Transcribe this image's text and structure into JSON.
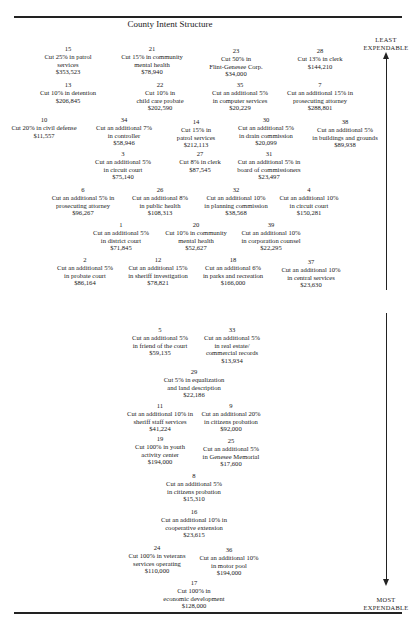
{
  "title": "County Intent Structure",
  "axis": {
    "top_label_line1": "LEAST",
    "top_label_line2": "EXPENDABLE",
    "bottom_label_line1": "MOST",
    "bottom_label_line2": "EXPENDABLE"
  },
  "items": [
    {
      "num": "15",
      "lines": [
        "Cut 25% in patrol",
        "services"
      ],
      "amount": "$353,523",
      "x": 68,
      "y": 45
    },
    {
      "num": "21",
      "lines": [
        "Cut 15% in community",
        "mental health"
      ],
      "amount": "$78,940",
      "x": 152,
      "y": 45
    },
    {
      "num": "23",
      "lines": [
        "Cut 50% in",
        "Flint-Genesee Corp."
      ],
      "amount": "$34,000",
      "x": 236,
      "y": 47
    },
    {
      "num": "28",
      "lines": [
        "Cut 13% in clerk"
      ],
      "amount": "$144,210",
      "x": 320,
      "y": 47
    },
    {
      "num": "13",
      "lines": [
        "Cut 10% in detention"
      ],
      "amount": "$206,845",
      "x": 68,
      "y": 81
    },
    {
      "num": "22",
      "lines": [
        "Cut 10% in",
        "child care probate"
      ],
      "amount": "$202,590",
      "x": 160,
      "y": 81
    },
    {
      "num": "35",
      "lines": [
        "Cut an additional 5%",
        "in computer services"
      ],
      "amount": "$20,229",
      "x": 240,
      "y": 81
    },
    {
      "num": "7",
      "lines": [
        "Cut an additional 15% in",
        "prosecuting attorney"
      ],
      "amount": "$288,801",
      "x": 320,
      "y": 81
    },
    {
      "num": "10",
      "lines": [
        "Cut 20% in civil defense"
      ],
      "amount": "$11,557",
      "x": 44,
      "y": 116
    },
    {
      "num": "34",
      "lines": [
        "Cut an additional 7%",
        "in controller"
      ],
      "amount": "$58,946",
      "x": 124,
      "y": 116
    },
    {
      "num": "14",
      "lines": [
        "Cut 15% in",
        "patrol services"
      ],
      "amount": "$212,113",
      "x": 196,
      "y": 118
    },
    {
      "num": "30",
      "lines": [
        "Cut an additional 5%",
        "in drain commission"
      ],
      "amount": "$20,099",
      "x": 266,
      "y": 116
    },
    {
      "num": "38",
      "lines": [
        "Cut an additional 5%",
        "in buildings and grounds"
      ],
      "amount": "$89,938",
      "x": 345,
      "y": 118
    },
    {
      "num": "3",
      "lines": [
        "Cut an additional 5%",
        "in circuit court"
      ],
      "amount": "$75,140",
      "x": 123,
      "y": 150
    },
    {
      "num": "27",
      "lines": [
        "Cut 8% in clerk"
      ],
      "amount": "$87,545",
      "x": 200,
      "y": 150
    },
    {
      "num": "31",
      "lines": [
        "Cut an additional 5% in",
        "board of commissioners"
      ],
      "amount": "$23,497",
      "x": 269,
      "y": 150
    },
    {
      "num": "6",
      "lines": [
        "Cut an additional 5% in",
        "prosecuting attorney"
      ],
      "amount": "$96,267",
      "x": 83,
      "y": 186
    },
    {
      "num": "26",
      "lines": [
        "Cut an additional 8%",
        "in public health"
      ],
      "amount": "$108,313",
      "x": 160,
      "y": 186
    },
    {
      "num": "32",
      "lines": [
        "Cut an additional 10%",
        "in planning commission"
      ],
      "amount": "$38,568",
      "x": 236,
      "y": 186
    },
    {
      "num": "4",
      "lines": [
        "Cut an additional 10%",
        "in circuit court"
      ],
      "amount": "$150,281",
      "x": 309,
      "y": 186
    },
    {
      "num": "1",
      "lines": [
        "Cut an additional 5%",
        "in district court"
      ],
      "amount": "$71,845",
      "x": 121,
      "y": 221
    },
    {
      "num": "20",
      "lines": [
        "Cut 10% in community",
        "mental health"
      ],
      "amount": "$52,627",
      "x": 196,
      "y": 221
    },
    {
      "num": "39",
      "lines": [
        "Cut an additional 10%",
        "in corporation counsel"
      ],
      "amount": "$22,295",
      "x": 271,
      "y": 221
    },
    {
      "num": "2",
      "lines": [
        "Cut an additional 5%",
        "in probate court"
      ],
      "amount": "$86,164",
      "x": 85,
      "y": 256
    },
    {
      "num": "12",
      "lines": [
        "Cut an additional 15%",
        "in sheriff investigation"
      ],
      "amount": "$78,821",
      "x": 158,
      "y": 256
    },
    {
      "num": "18",
      "lines": [
        "Cut an additional 6%",
        "in parks and recreation"
      ],
      "amount": "$166,000",
      "x": 233,
      "y": 256
    },
    {
      "num": "37",
      "lines": [
        "Cut an additional 10%",
        "in central services"
      ],
      "amount": "$23,630",
      "x": 311,
      "y": 258
    },
    {
      "num": "5",
      "lines": [
        "Cut an additional 5%",
        "in friend of the court"
      ],
      "amount": "$59,135",
      "x": 160,
      "y": 326
    },
    {
      "num": "33",
      "lines": [
        "Cut an additional 5%",
        "in real estate/",
        "commercial records"
      ],
      "amount": "$13,934",
      "x": 232,
      "y": 326
    },
    {
      "num": "29",
      "lines": [
        "Cut 5% in equalization",
        "and land description"
      ],
      "amount": "$22,186",
      "x": 194,
      "y": 368
    },
    {
      "num": "11",
      "lines": [
        "Cut an additional 10% in",
        "sheriff staff services"
      ],
      "amount": "$41,224",
      "x": 160,
      "y": 402
    },
    {
      "num": "9",
      "lines": [
        "Cut an additional 20%",
        "in citizens probation"
      ],
      "amount": "$92,000",
      "x": 231,
      "y": 402
    },
    {
      "num": "19",
      "lines": [
        "Cut 100% in youth",
        "activity center"
      ],
      "amount": "$194,000",
      "x": 160,
      "y": 435
    },
    {
      "num": "25",
      "lines": [
        "Cut an additional 5%",
        "in Genesee Memorial"
      ],
      "amount": "$17,600",
      "x": 231,
      "y": 437
    },
    {
      "num": "8",
      "lines": [
        "Cut an additional 5%",
        "in citizens probation"
      ],
      "amount": "$15,310",
      "x": 194,
      "y": 472
    },
    {
      "num": "16",
      "lines": [
        "Cut an additional 10% in",
        "cooperative extension"
      ],
      "amount": "$23,615",
      "x": 194,
      "y": 508
    },
    {
      "num": "24",
      "lines": [
        "Cut 100% in veterans",
        "services operating"
      ],
      "amount": "$110,000",
      "x": 157,
      "y": 544
    },
    {
      "num": "36",
      "lines": [
        "Cut an additional 10%",
        "in motor pool"
      ],
      "amount": "$194,000",
      "x": 229,
      "y": 546
    },
    {
      "num": "17",
      "lines": [
        "Cut 100% in",
        "economic development"
      ],
      "amount": "$128,000",
      "x": 194,
      "y": 579
    }
  ]
}
